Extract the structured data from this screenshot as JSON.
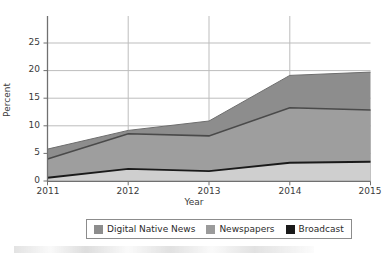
{
  "chart_data": {
    "type": "area",
    "stacked": true,
    "title": "",
    "subtitle": "",
    "xlabel": "Year",
    "ylabel": "Percent",
    "categories": [
      "2011",
      "2012",
      "2013",
      "2014",
      "2015"
    ],
    "x": [
      2011,
      2012,
      2013,
      2014,
      2015
    ],
    "xlim": [
      2011,
      2015
    ],
    "ylim": [
      0,
      30
    ],
    "yticks": [
      0,
      5,
      10,
      15,
      20,
      25
    ],
    "xticks": [
      2011,
      2012,
      2013,
      2014,
      2015
    ],
    "grid": true,
    "grid_axis": "y",
    "legend_position": "bottom",
    "series": [
      {
        "name": "Digital Native News",
        "color": "#8d8d8d",
        "values": [
          1.8,
          0.6,
          2.7,
          5.9,
          6.9
        ],
        "cumulative_top": [
          5.8,
          9.2,
          10.9,
          19.2,
          19.8
        ]
      },
      {
        "name": "Newspapers",
        "color": "#9b9b9b",
        "values": [
          3.4,
          6.4,
          6.4,
          10.0,
          9.4
        ],
        "cumulative_top": [
          4.0,
          8.6,
          8.2,
          13.3,
          12.9
        ]
      },
      {
        "name": "Broadcast",
        "color": "#1a1a1a",
        "values": [
          0.6,
          2.2,
          1.8,
          3.3,
          3.5
        ],
        "cumulative_top": [
          0.6,
          2.2,
          1.8,
          3.3,
          3.5
        ]
      }
    ]
  },
  "axes": {
    "ylabel": "Percent",
    "xlabel": "Year",
    "yticks": [
      {
        "label": "25",
        "value": 25
      },
      {
        "label": "20",
        "value": 20
      },
      {
        "label": "15",
        "value": 15
      },
      {
        "label": "10",
        "value": 10
      },
      {
        "label": "5",
        "value": 5
      },
      {
        "label": "0",
        "value": 0
      }
    ],
    "xticks": [
      {
        "label": "2011",
        "value": 2011
      },
      {
        "label": "2012",
        "value": 2012
      },
      {
        "label": "2013",
        "value": 2013
      },
      {
        "label": "2014",
        "value": 2014
      },
      {
        "label": "2015",
        "value": 2015
      }
    ]
  },
  "legend": {
    "entries": [
      {
        "label": "Digital Native News",
        "color": "#8d8d8d"
      },
      {
        "label": "Newspapers",
        "color": "#9b9b9b"
      },
      {
        "label": "Broadcast",
        "color": "#1a1a1a"
      }
    ]
  },
  "colors": {
    "digital_native_news": "#8d8d8d",
    "newspapers": "#9b9b9b",
    "broadcast": "#1a1a1a",
    "broadcast_fill": "#cccccc",
    "grid": "#b9b9b9",
    "axis": "#6f6f6f",
    "text": "#3a3a3a",
    "background": "#ffffff"
  }
}
